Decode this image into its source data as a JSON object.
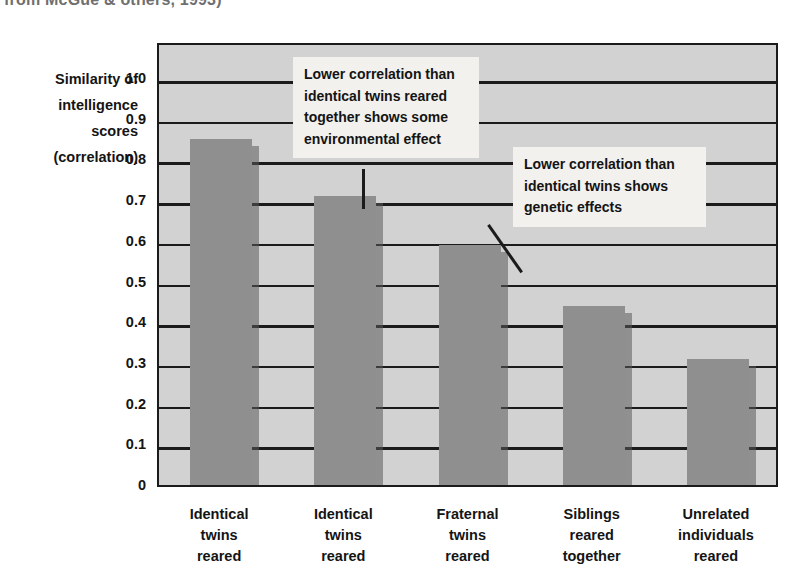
{
  "caption": {
    "cropped_line": "from McGue & others, 1993)"
  },
  "axis": {
    "y_title_lines": [
      "Similarity of",
      "intelligence",
      "scores",
      "(correlation)"
    ],
    "y_ticks": [
      "1.0",
      "0.9",
      "0.8",
      "0.7",
      "0.6",
      "0.5",
      "0.4",
      "0.3",
      "0.2",
      "0.1",
      "0"
    ]
  },
  "callouts": [
    {
      "text": "Lower correlation than identical twins reared together shows some environmental effect"
    },
    {
      "text": "Lower correlation than identical twins shows genetic effects"
    }
  ],
  "colors": {
    "bar": "#8f8f8f",
    "bar_shadow": "#5a5a5a",
    "plot_background": "#d2d2d2",
    "gridline": "#1b1b1b",
    "callout_background": "#f2f1ee",
    "text": "#141414"
  },
  "chart_data": {
    "type": "bar",
    "title": "",
    "xlabel": "",
    "ylabel": "Similarity of intelligence scores (correlation)",
    "ylim": [
      0,
      1.0
    ],
    "ytick_step": 0.1,
    "grid": true,
    "legend": null,
    "categories": [
      "Identical twins reared",
      "Identical twins reared",
      "Fraternal twins reared",
      "Siblings reared together",
      "Unrelated individuals reared"
    ],
    "category_lines": [
      [
        "Identical",
        "twins",
        "reared"
      ],
      [
        "Identical",
        "twins",
        "reared"
      ],
      [
        "Fraternal",
        "twins",
        "reared"
      ],
      [
        "Siblings",
        "reared",
        "together"
      ],
      [
        "Unrelated",
        "individuals",
        "reared"
      ]
    ],
    "values": [
      0.86,
      0.72,
      0.6,
      0.45,
      0.32
    ],
    "annotations": [
      {
        "text": "Lower correlation than identical twins reared together shows some environmental effect",
        "points_to_category": "Identical twins reared",
        "points_to_index": 1
      },
      {
        "text": "Lower correlation than identical twins shows genetic effects",
        "points_to_category": "Fraternal twins reared",
        "points_to_index": 2
      }
    ]
  }
}
